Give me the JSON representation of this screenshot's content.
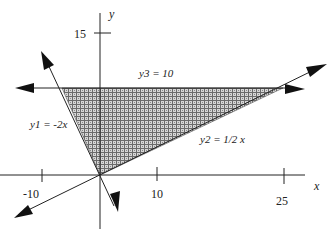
{
  "diagram": {
    "type": "linear-inequality-region",
    "axes": {
      "x_label": "x",
      "y_label": "y",
      "x_ticks": [
        {
          "value": -10,
          "label": "-10"
        },
        {
          "value": 10,
          "label": "10"
        },
        {
          "value": 25,
          "label": "25"
        }
      ],
      "y_ticks": [
        {
          "value": 15,
          "label": "15"
        }
      ]
    },
    "lines": [
      {
        "id": "y1",
        "label": "y1 = -2x",
        "equation": "y = -2x"
      },
      {
        "id": "y2",
        "label": "y2 = 1/2 x",
        "equation": "y = 0.5x"
      },
      {
        "id": "y3",
        "label": "y3 = 10",
        "equation": "y = 10"
      }
    ],
    "shaded_region": {
      "description": "Triangle bounded by y1, y2 and y3",
      "vertices": [
        [
          0,
          0
        ],
        [
          -5,
          10
        ],
        [
          20,
          10
        ]
      ],
      "fill": "crosshatch gray"
    },
    "colors": {
      "line": "#111111",
      "shade_dark": "#6f6f6f",
      "shade_light": "#d8d8d8",
      "background": "#ffffff"
    }
  }
}
